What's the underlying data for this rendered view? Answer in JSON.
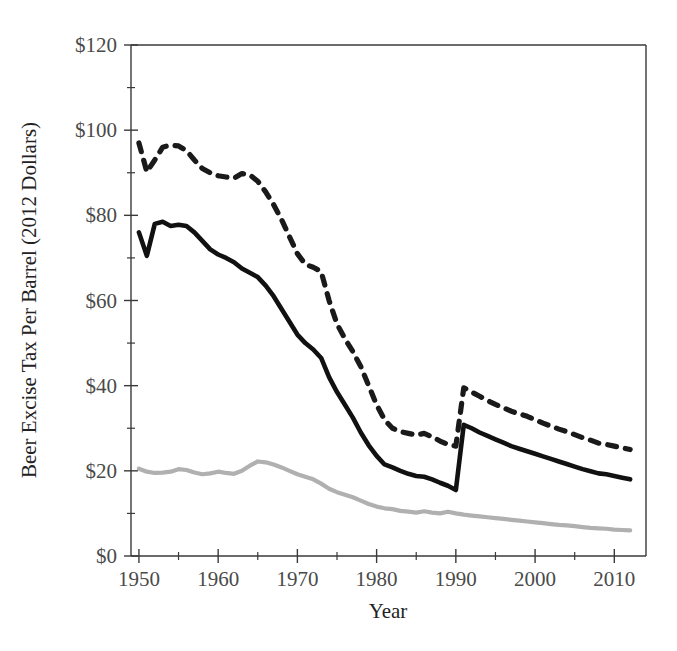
{
  "chart_data": {
    "type": "line",
    "title": "",
    "xlabel": "Year",
    "ylabel": "Beer Excise Tax Per Barrel (2012 Dollars)",
    "xlim": [
      1949,
      2014
    ],
    "ylim": [
      0,
      120
    ],
    "grid": false,
    "legend": "none",
    "x_tick_labels": [
      "1950",
      "1960",
      "1970",
      "1980",
      "1990",
      "2000",
      "2010"
    ],
    "x_ticks": [
      1950,
      1960,
      1970,
      1980,
      1990,
      2000,
      2010
    ],
    "x_minor_ticks": [
      1955,
      1965,
      1975,
      1985,
      1995,
      2005
    ],
    "y_tick_labels": [
      "$0",
      "$20",
      "$40",
      "$60",
      "$80",
      "$100",
      "$120"
    ],
    "y_ticks": [
      0,
      20,
      40,
      60,
      80,
      100,
      120
    ],
    "y_minor_ticks": [
      10,
      30,
      50,
      70,
      90,
      110
    ],
    "x": [
      1950,
      1951,
      1952,
      1953,
      1954,
      1955,
      1956,
      1957,
      1958,
      1959,
      1960,
      1961,
      1962,
      1963,
      1964,
      1965,
      1966,
      1967,
      1968,
      1969,
      1970,
      1971,
      1972,
      1973,
      1974,
      1975,
      1976,
      1977,
      1978,
      1979,
      1980,
      1981,
      1982,
      1983,
      1984,
      1985,
      1986,
      1987,
      1988,
      1989,
      1990,
      1991,
      1992,
      1993,
      1994,
      1995,
      1996,
      1997,
      1998,
      1999,
      2000,
      2001,
      2002,
      2003,
      2004,
      2005,
      2006,
      2007,
      2008,
      2009,
      2010,
      2011,
      2012
    ],
    "series": [
      {
        "name": "upper-dashed-series",
        "style": "dashed",
        "color": "#1a1a1a",
        "values": [
          97.0,
          90.2,
          93.0,
          96.0,
          96.5,
          96.3,
          95.2,
          93.0,
          91.0,
          90.0,
          89.3,
          89.0,
          88.7,
          89.8,
          89.5,
          88.0,
          85.5,
          82.5,
          79.0,
          75.0,
          71.0,
          68.5,
          67.8,
          66.8,
          60.0,
          54.5,
          51.0,
          48.0,
          44.5,
          40.0,
          35.5,
          32.0,
          30.0,
          29.2,
          28.8,
          28.4,
          28.8,
          28.0,
          27.0,
          26.2,
          25.8,
          39.5,
          38.5,
          37.5,
          36.5,
          35.6,
          34.8,
          34.0,
          33.4,
          32.8,
          32.0,
          31.2,
          30.5,
          29.8,
          29.2,
          28.5,
          27.8,
          27.2,
          26.5,
          26.2,
          25.8,
          25.4,
          25.0
        ]
      },
      {
        "name": "middle-solid-series",
        "style": "solid",
        "color": "#111111",
        "values": [
          76.0,
          70.5,
          78.0,
          78.5,
          77.5,
          77.8,
          77.5,
          76.0,
          74.0,
          72.0,
          70.8,
          70.0,
          69.0,
          67.5,
          66.5,
          65.5,
          63.5,
          61.0,
          58.0,
          55.0,
          52.0,
          50.0,
          48.5,
          46.5,
          42.0,
          38.5,
          35.5,
          32.5,
          29.0,
          26.0,
          23.5,
          21.5,
          20.8,
          20.0,
          19.3,
          18.8,
          18.6,
          18.0,
          17.2,
          16.5,
          15.5,
          30.8,
          30.0,
          29.0,
          28.2,
          27.4,
          26.6,
          25.8,
          25.2,
          24.6,
          24.0,
          23.4,
          22.8,
          22.2,
          21.6,
          21.0,
          20.4,
          19.9,
          19.4,
          19.2,
          18.8,
          18.4,
          18.0
        ]
      },
      {
        "name": "lower-gray-series",
        "style": "solid",
        "color": "#b0b0b0",
        "values": [
          20.5,
          19.8,
          19.5,
          19.6,
          19.8,
          20.4,
          20.2,
          19.6,
          19.2,
          19.4,
          19.8,
          19.5,
          19.3,
          20.0,
          21.2,
          22.2,
          22.0,
          21.5,
          20.8,
          20.0,
          19.2,
          18.6,
          18.0,
          17.0,
          15.8,
          15.0,
          14.4,
          13.8,
          13.0,
          12.2,
          11.6,
          11.2,
          11.0,
          10.6,
          10.4,
          10.2,
          10.5,
          10.2,
          10.0,
          10.4,
          10.0,
          9.7,
          9.5,
          9.3,
          9.1,
          8.9,
          8.7,
          8.5,
          8.3,
          8.1,
          7.9,
          7.7,
          7.5,
          7.3,
          7.2,
          7.0,
          6.8,
          6.6,
          6.5,
          6.4,
          6.2,
          6.1,
          6.0
        ]
      }
    ]
  },
  "axes": {
    "x_title": "Year",
    "y_title": "Beer Excise Tax Per Barrel (2012 Dollars)"
  },
  "colors": {
    "axis": "#3a3a3a",
    "tick_text": "#4a4a4a",
    "solid_series": "#111111",
    "dashed_series": "#1a1a1a",
    "gray_series": "#b0b0b0",
    "background": "#ffffff"
  }
}
